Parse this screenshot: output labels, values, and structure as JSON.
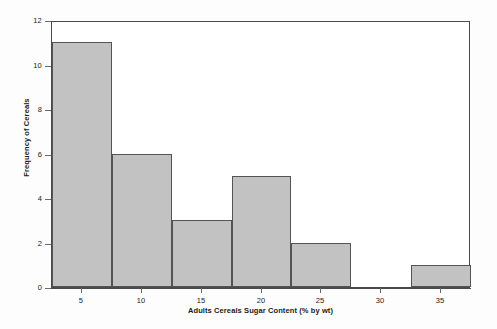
{
  "chart_data": {
    "type": "bar",
    "title": "",
    "xlabel": "Adults Cereals Sugar Content (% by wt)",
    "ylabel": "Frequency of Cereals",
    "xlim": [
      2.5,
      37.5
    ],
    "ylim": [
      0,
      12
    ],
    "xticks": [
      5,
      10,
      15,
      20,
      25,
      30,
      35
    ],
    "xtick_labels": [
      "5",
      "10",
      "15",
      "20",
      "25",
      "30",
      "35"
    ],
    "yticks": [
      0,
      2,
      4,
      6,
      8,
      10,
      12
    ],
    "ytick_labels": [
      "0",
      "2",
      "4",
      "6",
      "8",
      "10",
      "12"
    ],
    "grid": false,
    "legend": false,
    "bin_width": 5,
    "bins": [
      {
        "left": 2.5,
        "right": 7.5,
        "center": 5,
        "value": 11
      },
      {
        "left": 7.5,
        "right": 12.5,
        "center": 10,
        "value": 6
      },
      {
        "left": 12.5,
        "right": 17.5,
        "center": 15,
        "value": 3
      },
      {
        "left": 17.5,
        "right": 22.5,
        "center": 20,
        "value": 5
      },
      {
        "left": 22.5,
        "right": 27.5,
        "center": 25,
        "value": 2
      },
      {
        "left": 27.5,
        "right": 32.5,
        "center": 30,
        "value": 0
      },
      {
        "left": 32.5,
        "right": 37.5,
        "center": 35,
        "value": 1
      }
    ],
    "categories": [
      "2.5-7.5",
      "7.5-12.5",
      "12.5-17.5",
      "17.5-22.5",
      "22.5-27.5",
      "27.5-32.5",
      "32.5-37.5"
    ],
    "values": [
      11,
      6,
      3,
      5,
      2,
      0,
      1
    ],
    "colors": {
      "bar_fill": "#c2c2c2",
      "bar_edge": "#545454",
      "axis": "#4a4a4a",
      "text": "#1a1a1a",
      "plot_background": "#ffffff",
      "figure_background": "#fdfdfd"
    }
  }
}
